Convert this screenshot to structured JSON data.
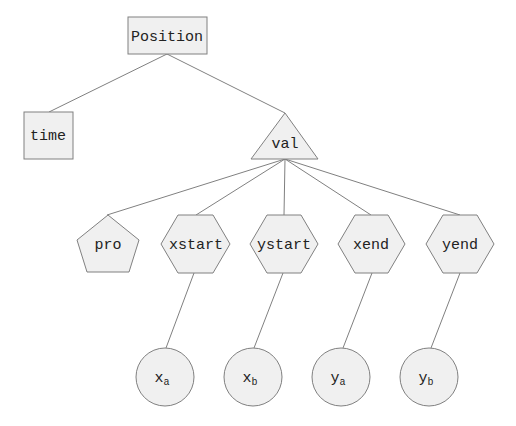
{
  "diagram": {
    "root": {
      "label": "Position",
      "shape": "rectangle"
    },
    "level1": [
      {
        "label": "time",
        "shape": "rectangle"
      },
      {
        "label": "val",
        "shape": "triangle"
      }
    ],
    "level2": [
      {
        "label": "pro",
        "shape": "pentagon"
      },
      {
        "label": "xstart",
        "shape": "hexagon"
      },
      {
        "label": "ystart",
        "shape": "hexagon"
      },
      {
        "label": "xend",
        "shape": "hexagon"
      },
      {
        "label": "yend",
        "shape": "hexagon"
      }
    ],
    "level3": [
      {
        "base": "x",
        "sub": "a",
        "shape": "circle",
        "parent": "xstart"
      },
      {
        "base": "x",
        "sub": "b",
        "shape": "circle",
        "parent": "ystart"
      },
      {
        "base": "y",
        "sub": "a",
        "shape": "circle",
        "parent": "xend"
      },
      {
        "base": "y",
        "sub": "b",
        "shape": "circle",
        "parent": "yend"
      }
    ],
    "colors": {
      "fill": "#f0f0f0",
      "stroke": "#808080",
      "edge": "#808080",
      "text": "#222222"
    }
  }
}
